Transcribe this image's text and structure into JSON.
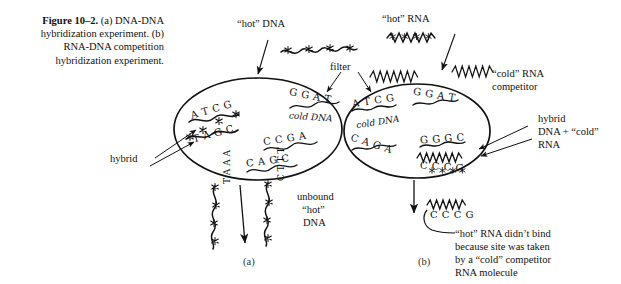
{
  "figure": {
    "number": "Figure 10–2.",
    "caption_rest": " (a) DNA-DNA hybridization experiment. (b) RNA-DNA competition hybridization experiment.",
    "caption_lines": [
      "Figure 10–2.  (a) DNA-",
      "DNA hybridization",
      "experiment. (b) RNA-",
      "DNA competition",
      "hybridization",
      "experiment."
    ]
  },
  "panels": {
    "a": "(a)",
    "b": "(b)"
  },
  "labels": {
    "hot_dna": "“hot” DNA",
    "hot_rna": "“hot” RNA",
    "filter": "filter",
    "hybrid": "hybrid",
    "cold_rna_competitor_l1": "“cold” RNA",
    "cold_rna_competitor_l2": "competitor",
    "hybrid_dna_cold_rna_l1": "hybrid",
    "hybrid_dna_cold_rna_l2": "DNA + “cold”",
    "hybrid_dna_cold_rna_l3": "RNA",
    "unbound_l1": "unbound",
    "unbound_l2": "“hot”",
    "unbound_l3": "DNA",
    "explanation_l1": "“hot” RNA didn’t bind",
    "explanation_l2": "because site was taken",
    "explanation_l3": "by a “cold” competitor",
    "explanation_l4": "RNA molecule"
  },
  "panel_a": {
    "filter_oval_label": "filter",
    "cold_dna_note": "cold DNA",
    "sequences": {
      "hybrid_top": "A T C G",
      "hybrid_bottom": "T A G C",
      "free_1": "G G A T",
      "free_2": "C C G A",
      "free_3": "C A G C"
    },
    "unbound_strand_left": "T A A A",
    "unbound_strand_right": "C T T T",
    "unbound_left_letters": [
      "T",
      "A",
      "A",
      "A"
    ],
    "unbound_right_letters": [
      "C",
      "T",
      "T",
      "T"
    ]
  },
  "panel_b": {
    "cold_dna_note": "cold DNA",
    "sequences": {
      "free_1": "A T C G",
      "free_2": "G G A T",
      "free_3": "C A G A",
      "hybrid_top": "G G G C",
      "hybrid_bottom": "C C C G"
    },
    "output_sequence": "C C C G"
  },
  "colors": {
    "ink": "#111111",
    "paper": "#ffffff",
    "label_gray": "#333333"
  },
  "icons": {
    "radioactive_mark": "asterisk-star-icon",
    "dna_strand": "wavy-strand-icon",
    "rna_strand": "zigzag-strand-icon",
    "arrow": "arrow-icon",
    "oval": "filter-oval-icon"
  }
}
